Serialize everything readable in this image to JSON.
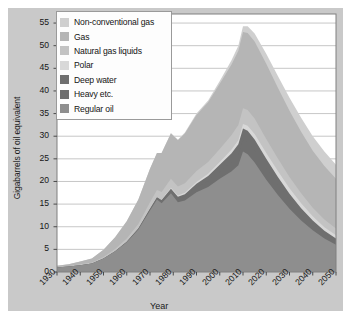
{
  "chart_data": {
    "type": "area",
    "stacked": true,
    "title": "",
    "xlabel": "Year",
    "ylabel": "Gigabarrels of oil equivalent",
    "xlim": [
      1930,
      2050
    ],
    "ylim": [
      0,
      57
    ],
    "yticks": [
      0,
      5,
      10,
      15,
      20,
      25,
      30,
      35,
      40,
      45,
      50,
      55
    ],
    "xticks": [
      1930,
      1940,
      1950,
      1960,
      1970,
      1980,
      1990,
      2000,
      2010,
      2020,
      2030,
      2040,
      2050
    ],
    "grid": "horizontal",
    "legend_position": "top-left",
    "x": [
      1930,
      1935,
      1940,
      1945,
      1950,
      1955,
      1960,
      1965,
      1970,
      1973,
      1975,
      1979,
      1982,
      1985,
      1990,
      1995,
      2000,
      2005,
      2008,
      2010,
      2012,
      2015,
      2020,
      2025,
      2030,
      2035,
      2040,
      2045,
      2050
    ],
    "series": [
      {
        "name": "Regular oil",
        "color": "#8e8e8e",
        "values": [
          1.0,
          1.2,
          1.5,
          1.9,
          3.0,
          4.6,
          6.6,
          9.4,
          13.6,
          16.0,
          15.2,
          17.4,
          15.4,
          15.8,
          17.6,
          18.8,
          20.6,
          22.2,
          23.6,
          26.6,
          26.0,
          24.2,
          20.4,
          17.0,
          14.0,
          11.4,
          9.2,
          7.4,
          6.0
        ]
      },
      {
        "name": "Heavy etc.",
        "color": "#6f6f6f",
        "values": [
          0.0,
          0.0,
          0.0,
          0.0,
          0.0,
          0.0,
          0.1,
          0.2,
          0.3,
          0.4,
          0.5,
          0.7,
          0.8,
          0.9,
          1.1,
          1.3,
          1.6,
          2.0,
          2.3,
          2.6,
          2.7,
          2.7,
          2.6,
          2.4,
          2.1,
          1.8,
          1.5,
          1.2,
          1.0
        ]
      },
      {
        "name": "Deep water",
        "color": "#6f6f6f",
        "values": [
          0.0,
          0.0,
          0.0,
          0.0,
          0.0,
          0.0,
          0.0,
          0.0,
          0.1,
          0.1,
          0.2,
          0.3,
          0.4,
          0.5,
          0.8,
          1.1,
          1.5,
          2.0,
          2.3,
          2.5,
          2.5,
          2.4,
          2.0,
          1.6,
          1.2,
          0.9,
          0.7,
          0.5,
          0.4
        ]
      },
      {
        "name": "Polar",
        "color": "#d8d8d8",
        "values": [
          0.0,
          0.0,
          0.0,
          0.0,
          0.0,
          0.0,
          0.0,
          0.0,
          0.0,
          0.0,
          0.1,
          0.2,
          0.3,
          0.3,
          0.4,
          0.5,
          0.6,
          0.8,
          0.9,
          1.0,
          1.1,
          1.2,
          1.3,
          1.3,
          1.2,
          1.1,
          0.9,
          0.8,
          0.7
        ]
      },
      {
        "name": "Natural gas liquids",
        "color": "#c3c3c3",
        "values": [
          0.1,
          0.1,
          0.2,
          0.2,
          0.3,
          0.5,
          0.7,
          1.0,
          1.4,
          1.6,
          1.7,
          2.0,
          2.0,
          2.1,
          2.4,
          2.6,
          2.9,
          3.2,
          3.4,
          3.5,
          3.5,
          3.4,
          3.1,
          2.8,
          2.5,
          2.2,
          1.9,
          1.7,
          1.5
        ]
      },
      {
        "name": "Gas",
        "color": "#b5b5b5",
        "values": [
          0.3,
          0.4,
          0.6,
          0.9,
          1.6,
          2.6,
          3.8,
          5.4,
          7.4,
          8.2,
          8.6,
          10.0,
          10.2,
          11.0,
          12.4,
          13.2,
          14.4,
          15.6,
          16.4,
          16.8,
          17.0,
          17.0,
          16.6,
          15.6,
          14.6,
          13.6,
          12.6,
          11.8,
          11.0
        ]
      },
      {
        "name": "Non-conventional gas",
        "color": "#cfcfcf",
        "values": [
          0.0,
          0.0,
          0.0,
          0.0,
          0.0,
          0.0,
          0.0,
          0.0,
          0.0,
          0.0,
          0.0,
          0.1,
          0.1,
          0.2,
          0.3,
          0.4,
          0.6,
          0.9,
          1.1,
          1.3,
          1.5,
          1.8,
          2.2,
          2.6,
          2.9,
          3.1,
          3.2,
          3.2,
          3.1
        ]
      }
    ],
    "legend_order": [
      "Non-conventional gas",
      "Gas",
      "Natural gas liquids",
      "Polar",
      "Deep water",
      "Heavy etc.",
      "Regular oil"
    ],
    "colors": {
      "non_conventional_gas": "#cfcfcf",
      "gas": "#b5b5b5",
      "natural_gas_liquids": "#c3c3c3",
      "polar": "#d8d8d8",
      "deep_water": "#6f6f6f",
      "heavy_etc": "#6f6f6f",
      "regular_oil": "#8e8e8e",
      "figure_background": "#c9c9c9",
      "plot_background": "#ffffff",
      "grid": "#b9b9b9",
      "frame": "#808080"
    }
  }
}
